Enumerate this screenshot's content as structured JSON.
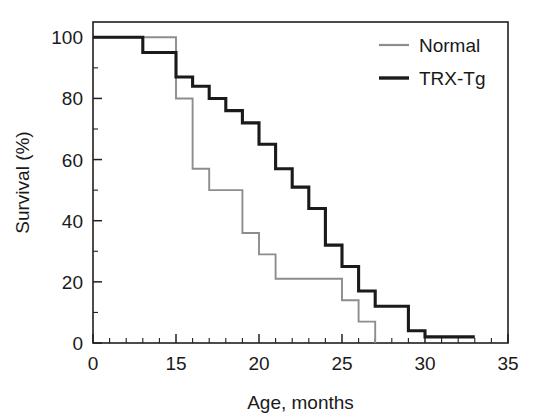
{
  "chart_data": {
    "type": "line",
    "subtype": "kaplan-meier-step",
    "title": "",
    "xlabel": "Age,  months",
    "ylabel": "Survival (%)",
    "xlim": [
      0,
      35
    ],
    "ylim": [
      0,
      105
    ],
    "grid": false,
    "legend_position": "top-right",
    "x_ticks_major": [
      0,
      15,
      20,
      25,
      30,
      35
    ],
    "x_tick_labels": [
      "0",
      "15",
      "20",
      "25",
      "30",
      "35"
    ],
    "x_ticks_minor_count_between": 4,
    "y_ticks_major": [
      0,
      20,
      40,
      60,
      80,
      100
    ],
    "y_tick_labels": [
      "0",
      "20",
      "40",
      "60",
      "80",
      "100"
    ],
    "y_ticks_minor": [
      10,
      30,
      50,
      70,
      90
    ],
    "series": [
      {
        "name": "Normal",
        "color": "#8d8d8d",
        "x": [
          0,
          15,
          15,
          16,
          16,
          17,
          17,
          19,
          19,
          20,
          20,
          21,
          21,
          25,
          25,
          26,
          26,
          27,
          27
        ],
        "y": [
          100,
          100,
          80,
          80,
          57,
          57,
          50,
          50,
          36,
          36,
          29,
          29,
          21,
          21,
          14,
          14,
          7,
          7,
          0
        ]
      },
      {
        "name": "TRX-Tg",
        "color": "#1a1a1a",
        "x": [
          0,
          9,
          9,
          15,
          15,
          16,
          16,
          17,
          17,
          18,
          18,
          19,
          19,
          20,
          20,
          21,
          21,
          22,
          22,
          23,
          23,
          24,
          24,
          25,
          25,
          26,
          26,
          27,
          27,
          29,
          29,
          30,
          30,
          33
        ],
        "y": [
          100,
          100,
          95,
          95,
          87,
          87,
          84,
          84,
          80,
          80,
          76,
          76,
          72,
          72,
          65,
          65,
          57,
          57,
          51,
          51,
          44,
          44,
          32,
          32,
          25,
          25,
          17,
          17,
          12,
          12,
          4,
          4,
          2,
          2
        ]
      }
    ]
  },
  "legend": {
    "entries": [
      {
        "label": "Normal",
        "color": "#8d8d8d"
      },
      {
        "label": "TRX-Tg",
        "color": "#1a1a1a"
      }
    ]
  },
  "axes": {
    "x_title": "Age,  months",
    "y_title": "Survival (%)"
  }
}
